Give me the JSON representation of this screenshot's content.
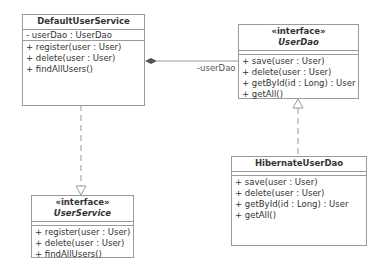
{
  "classes": {
    "default_user_service": {
      "name": "DefaultUserService",
      "attributes": [
        "- userDao : UserDao"
      ],
      "operations": [
        "+ register(user : User)",
        "+ delete(user : User)",
        "+ findAllUsers()"
      ]
    },
    "user_dao": {
      "stereotype": "«interface»",
      "name": "UserDao",
      "attributes": [],
      "operations": [
        "+ save(user : User)",
        "+ delete(user : User)",
        "+ getById(id : Long) : User",
        "+ getAll()"
      ]
    },
    "hibernate_user_dao": {
      "name": "HibernateUserDao",
      "attributes": [],
      "operations": [
        "+ save(user : User)",
        "+ delete(user : User)",
        "+ getById(id : Long) : User",
        "+ getAll()"
      ]
    },
    "user_service": {
      "stereotype": "«interface»",
      "name": "UserService",
      "attributes": [],
      "operations": [
        "+ register(user : User)",
        "+ delete(user : User)",
        "+ findAllUsers()"
      ]
    }
  },
  "relations": {
    "composition_label": "-userDao"
  },
  "colors": {
    "border": "#9a9a9a",
    "line": "#999999",
    "diamond": "#555555"
  }
}
